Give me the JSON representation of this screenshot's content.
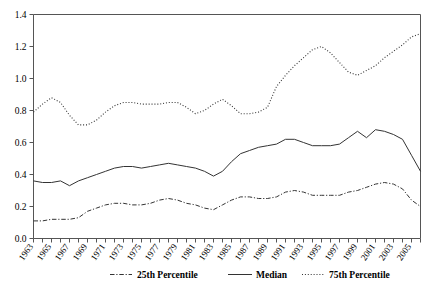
{
  "chart_data": {
    "type": "line",
    "title": "",
    "xlabel": "",
    "ylabel": "",
    "ylim": [
      0.0,
      1.4
    ],
    "xlim": [
      1963,
      2006
    ],
    "grid": false,
    "legend_position": "bottom",
    "ytick_labels": [
      "0.0",
      "0.2",
      "0.4",
      "0.6",
      "0.8",
      "1.0",
      "1.2",
      "1.4"
    ],
    "ytick_values": [
      0.0,
      0.2,
      0.4,
      0.6,
      0.8,
      1.0,
      1.2,
      1.4
    ],
    "xtick_labels": [
      "1963",
      "1965",
      "1967",
      "1969",
      "1971",
      "1973",
      "1975",
      "1977",
      "1979",
      "1981",
      "1983",
      "1985",
      "1987",
      "1989",
      "1991",
      "1993",
      "1995",
      "1997",
      "1999",
      "2001",
      "2003",
      "2005"
    ],
    "x": [
      1963,
      1964,
      1965,
      1966,
      1967,
      1968,
      1969,
      1970,
      1971,
      1972,
      1973,
      1974,
      1975,
      1976,
      1977,
      1978,
      1979,
      1980,
      1981,
      1982,
      1983,
      1984,
      1985,
      1986,
      1987,
      1988,
      1989,
      1990,
      1991,
      1992,
      1993,
      1994,
      1995,
      1996,
      1997,
      1998,
      1999,
      2000,
      2001,
      2002,
      2003,
      2004,
      2005,
      2006
    ],
    "series": [
      {
        "name": "25th Percentile",
        "style": "dash-dot",
        "color": "#333333",
        "values": [
          0.11,
          0.11,
          0.12,
          0.12,
          0.12,
          0.13,
          0.17,
          0.19,
          0.21,
          0.22,
          0.22,
          0.21,
          0.21,
          0.22,
          0.24,
          0.25,
          0.24,
          0.22,
          0.21,
          0.19,
          0.18,
          0.21,
          0.24,
          0.26,
          0.26,
          0.25,
          0.25,
          0.26,
          0.29,
          0.3,
          0.29,
          0.27,
          0.27,
          0.27,
          0.27,
          0.29,
          0.3,
          0.32,
          0.34,
          0.35,
          0.34,
          0.31,
          0.24,
          0.2
        ]
      },
      {
        "name": "Median",
        "style": "solid",
        "color": "#333333",
        "values": [
          0.36,
          0.35,
          0.35,
          0.36,
          0.33,
          0.36,
          0.38,
          0.4,
          0.42,
          0.44,
          0.45,
          0.45,
          0.44,
          0.45,
          0.46,
          0.47,
          0.46,
          0.45,
          0.44,
          0.42,
          0.39,
          0.42,
          0.48,
          0.53,
          0.55,
          0.57,
          0.58,
          0.59,
          0.62,
          0.62,
          0.6,
          0.58,
          0.58,
          0.58,
          0.59,
          0.63,
          0.67,
          0.63,
          0.68,
          0.67,
          0.65,
          0.62,
          0.52,
          0.42
        ]
      },
      {
        "name": "75th Percentile",
        "style": "dotted",
        "color": "#333333",
        "values": [
          0.79,
          0.84,
          0.88,
          0.85,
          0.77,
          0.71,
          0.71,
          0.74,
          0.79,
          0.83,
          0.85,
          0.85,
          0.84,
          0.84,
          0.84,
          0.85,
          0.85,
          0.82,
          0.78,
          0.8,
          0.84,
          0.87,
          0.83,
          0.78,
          0.78,
          0.79,
          0.82,
          0.95,
          1.02,
          1.08,
          1.13,
          1.18,
          1.2,
          1.16,
          1.1,
          1.04,
          1.02,
          1.05,
          1.08,
          1.13,
          1.17,
          1.21,
          1.26,
          1.28
        ]
      }
    ]
  },
  "legend": {
    "items": [
      {
        "label": "25th Percentile",
        "style": "dash-dot"
      },
      {
        "label": "Median",
        "style": "solid"
      },
      {
        "label": "75th Percentile",
        "style": "dotted"
      }
    ]
  }
}
